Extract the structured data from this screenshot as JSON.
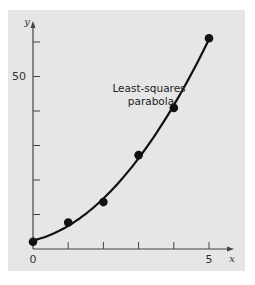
{
  "chart_data": {
    "type": "scatter",
    "title": "",
    "xlabel": "x",
    "ylabel": "y",
    "x": [
      0,
      1,
      2,
      3,
      4,
      5
    ],
    "series": [
      {
        "name": "data",
        "kind": "points",
        "values": [
          2.1,
          7.7,
          13.6,
          27.2,
          40.9,
          61.1
        ]
      },
      {
        "name": "Least-squares parabola",
        "kind": "curve",
        "equation": "y = 2.4786 + 2.3593x + 1.8607x^2",
        "coefficients": [
          2.4786,
          2.3593,
          1.8607
        ]
      }
    ],
    "xlim": [
      0,
      5.7
    ],
    "ylim": [
      0,
      65
    ],
    "x_ticks": [
      0,
      1,
      2,
      3,
      4,
      5
    ],
    "x_tick_labels": [
      "0",
      "",
      "",
      "",
      "",
      "5"
    ],
    "y_ticks": [
      0,
      10,
      20,
      30,
      40,
      50,
      60
    ],
    "y_tick_labels": [
      "",
      "",
      "",
      "",
      "",
      "50",
      ""
    ],
    "annotations": [
      {
        "text": "Least-squares parabola",
        "lines": [
          "Least-squares",
          "parabola"
        ]
      }
    ],
    "grid": false,
    "legend": "none"
  },
  "labels": {
    "x_axis": "x",
    "y_axis": "y",
    "origin": "0",
    "x_five": "5",
    "y_fifty": "50",
    "annot_line1": "Least-squares",
    "annot_line2": "parabola"
  },
  "colors": {
    "panel": "#e6e6e6",
    "background": "#ffffff",
    "ink": "#111111",
    "axis": "#444444"
  }
}
